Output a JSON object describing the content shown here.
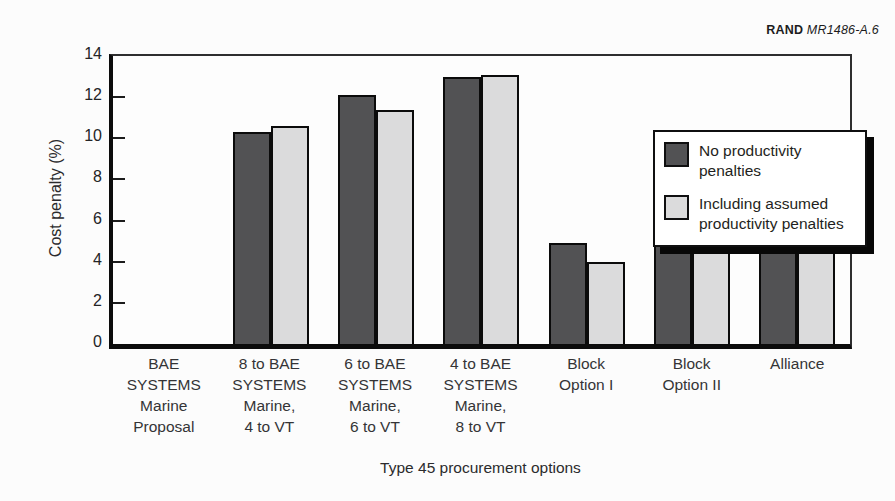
{
  "header": {
    "brand": "RAND",
    "code": "MR1486-A.6"
  },
  "chart_data": {
    "type": "bar",
    "title": "",
    "xlabel": "Type 45 procurement options",
    "ylabel": "Cost penalty (%)",
    "ylim": [
      0,
      14
    ],
    "yticks": [
      0,
      2,
      4,
      6,
      8,
      10,
      12,
      14
    ],
    "grid": false,
    "legend_position": "upper-right-inside",
    "categories": [
      "BAE SYSTEMS Marine Proposal",
      "8 to BAE SYSTEMS Marine, 4 to VT",
      "6 to BAE SYSTEMS Marine, 6 to VT",
      "4 to BAE SYSTEMS Marine, 8 to VT",
      "Block Option I",
      "Block Option II",
      "Alliance"
    ],
    "category_label_lines": [
      [
        "BAE",
        "SYSTEMS",
        "Marine",
        "Proposal"
      ],
      [
        "8 to BAE",
        "SYSTEMS",
        "Marine,",
        "4 to VT"
      ],
      [
        "6 to BAE",
        "SYSTEMS",
        "Marine,",
        "6 to VT"
      ],
      [
        "4 to BAE",
        "SYSTEMS",
        "Marine,",
        "8 to VT"
      ],
      [
        "Block",
        "Option I"
      ],
      [
        "Block",
        "Option II"
      ],
      [
        "Alliance"
      ]
    ],
    "series": [
      {
        "name": "No productivity penalties",
        "color": "#525254",
        "values": [
          0,
          10.2,
          12.0,
          12.9,
          4.8,
          5.3,
          10.0
        ]
      },
      {
        "name": "Including assumed productivity penalties",
        "color": "#dbdbdc",
        "values": [
          0,
          10.5,
          11.3,
          13.0,
          3.9,
          4.4,
          10.2
        ]
      }
    ]
  },
  "colors": {
    "axis": "#0c0c0c",
    "bar_border": "#0b0b0b",
    "legend_shadow": "#070707",
    "background": "#fcfcfc"
  }
}
